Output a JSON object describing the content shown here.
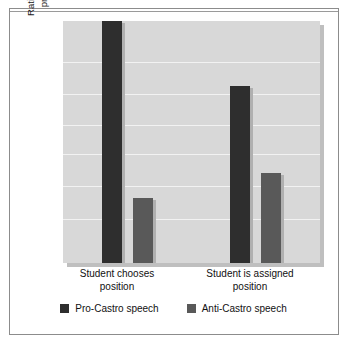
{
  "figure": {
    "background_color": "#ffffff",
    "frame_color": "#8c8c8c",
    "plot_background_color": "#d8d8d8",
    "gridline_color": "#f2f2f2"
  },
  "chart_data": {
    "type": "bar",
    "title": "",
    "xlabel": "",
    "ylabel": "Rating of the Students' pro-Castro attitude",
    "ylabel_lines": [
      "Rating of the Students'",
      "pro-Castro attitude"
    ],
    "categories": [
      "Student chooses position",
      "Student is assigned position"
    ],
    "category_lines": [
      [
        "Student chooses",
        "position"
      ],
      [
        "Student is assigned",
        "position"
      ]
    ],
    "series": [
      {
        "name": "Pro-Castro speech",
        "color": "#2e2e2e",
        "values": [
          100,
          73
        ]
      },
      {
        "name": "Anti-Castro speech",
        "color": "#595959",
        "values": [
          27,
          37
        ]
      }
    ],
    "ylim": [
      0,
      100
    ],
    "ytick_labels": [],
    "gridlines": [
      0.17,
      0.3,
      0.43,
      0.55,
      0.68,
      0.82
    ],
    "grid": true,
    "legend_position": "bottom"
  },
  "legend": {
    "items": [
      {
        "label": "Pro-Castro speech",
        "color": "#2e2e2e"
      },
      {
        "label": "Anti-Castro speech",
        "color": "#595959"
      }
    ]
  }
}
